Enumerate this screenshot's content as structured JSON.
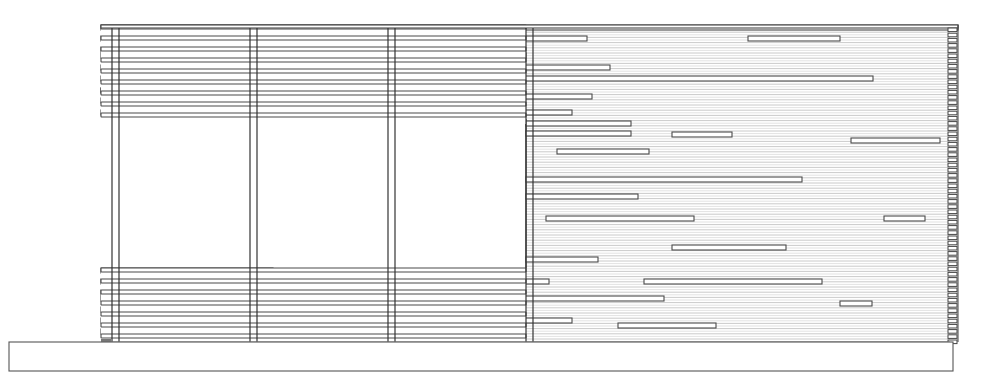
{
  "drawing": {
    "type": "architectural-elevation",
    "subject": "horizontal slatted wood screen / fence elevation",
    "colors": {
      "background": "#ffffff",
      "line": "#4a4a4a",
      "hatch": "#bdbdbd"
    },
    "frame": {
      "x1": 101,
      "x2": 958,
      "top": 25,
      "bottom": 342
    },
    "base": {
      "x": 9,
      "y": 342,
      "width": 944,
      "height": 29
    },
    "posts_x": [
      112,
      119,
      250,
      257,
      388,
      395,
      526,
      533
    ],
    "opening": {
      "x": 119,
      "y": 119,
      "width": 407,
      "height": 149
    },
    "upper_rows_y": [
      25,
      36,
      47,
      58,
      69,
      80,
      91,
      102,
      113
    ],
    "lower_rows_y": [
      268,
      279,
      290,
      301,
      312,
      323,
      334
    ],
    "hatch": {
      "y_start": 27,
      "y_end": 342,
      "pitch": 2.6,
      "x_start": 101,
      "x_end": 950
    },
    "boards": [
      {
        "y": 25,
        "x1": 101,
        "x2": 958
      },
      {
        "y": 36,
        "x1": 101,
        "x2": 388
      },
      {
        "y": 36,
        "x1": 395,
        "x2": 587
      },
      {
        "y": 36,
        "x1": 748,
        "x2": 840
      },
      {
        "y": 47,
        "x1": 101,
        "x2": 387
      },
      {
        "y": 53,
        "x1": 101,
        "x2": 227
      },
      {
        "y": 53,
        "x1": 357,
        "x2": 526
      },
      {
        "y": 65,
        "x1": 101,
        "x2": 296
      },
      {
        "y": 65,
        "x1": 508,
        "x2": 610
      },
      {
        "y": 76,
        "x1": 101,
        "x2": 873
      },
      {
        "y": 88,
        "x1": 101,
        "x2": 342
      },
      {
        "y": 88,
        "x1": 101,
        "x2": 342
      },
      {
        "y": 98,
        "x1": 101,
        "x2": 150
      },
      {
        "y": 98,
        "x1": 307,
        "x2": 426
      },
      {
        "y": 94,
        "x1": 496,
        "x2": 592
      },
      {
        "y": 110,
        "x1": 101,
        "x2": 318
      },
      {
        "y": 110,
        "x1": 467,
        "x2": 572
      },
      {
        "y": 121,
        "x1": 526,
        "x2": 631
      },
      {
        "y": 131,
        "x1": 526,
        "x2": 631
      },
      {
        "y": 132,
        "x1": 672,
        "x2": 732
      },
      {
        "y": 138,
        "x1": 851,
        "x2": 940
      },
      {
        "y": 149,
        "x1": 557,
        "x2": 649
      },
      {
        "y": 177,
        "x1": 526,
        "x2": 802
      },
      {
        "y": 194,
        "x1": 526,
        "x2": 638
      },
      {
        "y": 216,
        "x1": 546,
        "x2": 694
      },
      {
        "y": 216,
        "x1": 884,
        "x2": 925
      },
      {
        "y": 245,
        "x1": 672,
        "x2": 786
      },
      {
        "y": 257,
        "x1": 526,
        "x2": 598
      },
      {
        "y": 268,
        "x1": 101,
        "x2": 273
      },
      {
        "y": 279,
        "x1": 101,
        "x2": 357
      },
      {
        "y": 279,
        "x1": 443,
        "x2": 549
      },
      {
        "y": 279,
        "x1": 644,
        "x2": 822
      },
      {
        "y": 290,
        "x1": 101,
        "x2": 357
      },
      {
        "y": 296,
        "x1": 101,
        "x2": 168
      },
      {
        "y": 296,
        "x1": 296,
        "x2": 664
      },
      {
        "y": 301,
        "x1": 840,
        "x2": 872
      },
      {
        "y": 307,
        "x1": 101,
        "x2": 312
      },
      {
        "y": 312,
        "x1": 335,
        "x2": 388
      },
      {
        "y": 318,
        "x1": 101,
        "x2": 220
      },
      {
        "y": 318,
        "x1": 467,
        "x2": 572
      },
      {
        "y": 323,
        "x1": 618,
        "x2": 716
      },
      {
        "y": 329,
        "x1": 101,
        "x2": 420
      }
    ]
  }
}
